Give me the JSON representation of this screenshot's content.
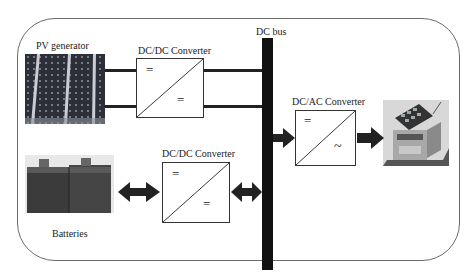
{
  "diagram": {
    "labels": {
      "pv_generator": "PV generator",
      "dcdc_top": "DC/DC Converter",
      "dc_bus": "DC bus",
      "dcac": "DC/AC Converter",
      "dcdc_bottom": "DC/DC Converter",
      "batteries": "Batteries"
    },
    "symbols": {
      "dc": "=",
      "ac": "~"
    },
    "nodes": [
      {
        "id": "pv",
        "label": "PV generator",
        "type": "image-solar-panel"
      },
      {
        "id": "dcdc1",
        "label": "DC/DC Converter",
        "type": "converter",
        "in": "=",
        "out": "="
      },
      {
        "id": "bus",
        "label": "DC bus",
        "type": "bus"
      },
      {
        "id": "dcac",
        "label": "DC/AC Converter",
        "type": "converter",
        "in": "=",
        "out": "~"
      },
      {
        "id": "house",
        "label": "",
        "type": "image-house-load"
      },
      {
        "id": "dcdc2",
        "label": "DC/DC Converter",
        "type": "converter",
        "in": "=",
        "out": "="
      },
      {
        "id": "bat",
        "label": "Batteries",
        "type": "image-batteries"
      }
    ],
    "edges": [
      {
        "from": "pv",
        "to": "dcdc1",
        "style": "double-line"
      },
      {
        "from": "dcdc1",
        "to": "bus",
        "style": "double-line"
      },
      {
        "from": "bus",
        "to": "dcac",
        "style": "arrow"
      },
      {
        "from": "dcac",
        "to": "house",
        "style": "arrow"
      },
      {
        "from": "bat",
        "to": "dcdc2",
        "style": "bidirectional-arrow"
      },
      {
        "from": "dcdc2",
        "to": "bus",
        "style": "bidirectional-arrow"
      }
    ],
    "colors": {
      "frame": "#6a6a6a",
      "bus": "#111111",
      "arrow": "#222222"
    }
  }
}
